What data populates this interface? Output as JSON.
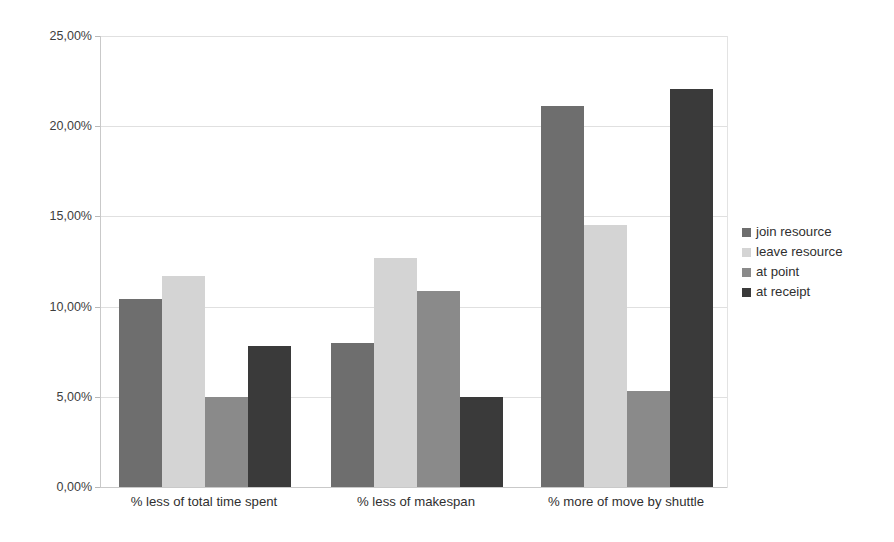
{
  "chart_data": {
    "type": "bar",
    "title": "",
    "subtitle": "",
    "xlabel": "",
    "ylabel": "",
    "grid": true,
    "legend_position": "right",
    "value_format": "percent-comma",
    "categories": [
      "% less of total time spent",
      "% less of makespan",
      "% more of move by shuttle"
    ],
    "ylim": [
      0,
      25
    ],
    "ytick_values": [
      0,
      5,
      10,
      15,
      20,
      25
    ],
    "ytick_labels": [
      "0,00%",
      "5,00%",
      "10,00%",
      "15,00%",
      "20,00%",
      "25,00%"
    ],
    "series": [
      {
        "name": "join resource",
        "color": "#6e6e6e",
        "values": [
          10.4,
          8.0,
          21.1
        ]
      },
      {
        "name": "leave resource",
        "color": "#d4d4d4",
        "values": [
          11.7,
          12.7,
          14.55
        ]
      },
      {
        "name": "at point",
        "color": "#8a8a8a",
        "values": [
          5.0,
          10.85,
          5.3
        ]
      },
      {
        "name": "at receipt",
        "color": "#3a3a3a",
        "values": [
          7.8,
          5.0,
          22.05
        ]
      }
    ]
  },
  "legend": {
    "items": [
      {
        "label": "join resource",
        "color": "#6e6e6e"
      },
      {
        "label": "leave resource",
        "color": "#d4d4d4"
      },
      {
        "label": "at point",
        "color": "#8a8a8a"
      },
      {
        "label": "at receipt",
        "color": "#3a3a3a"
      }
    ]
  },
  "axis": {
    "y_labels": [
      "0,00%",
      "5,00%",
      "10,00%",
      "15,00%",
      "20,00%",
      "25,00%"
    ],
    "x_labels": [
      "% less of total time spent",
      "% less of makespan",
      "% more of move by shuttle"
    ]
  }
}
